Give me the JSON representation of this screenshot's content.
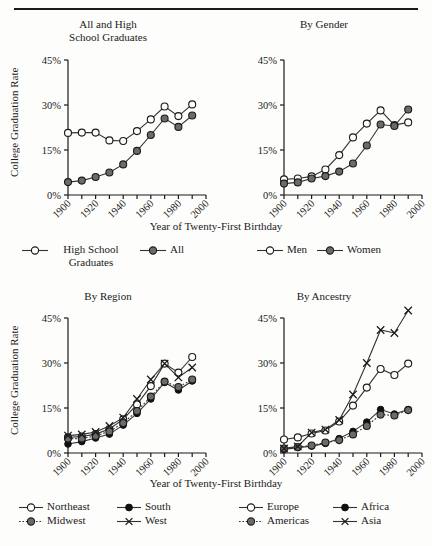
{
  "figure": {
    "has_top_rule": true,
    "y_axis_label": "College Graduation Rate",
    "x_axis_title": "Year of Twenty-First Birthday",
    "y_ticks": [
      "0%",
      "15%",
      "30%",
      "45%"
    ],
    "x_ticks": [
      "1900",
      "1920",
      "1940",
      "1960",
      "1980",
      "2000"
    ]
  },
  "chart_data": [
    {
      "type": "line",
      "title": "All and High School Graduates",
      "xlabel": "Year of Twenty-First Birthday",
      "ylabel": "College Graduation Rate",
      "xlim": [
        1900,
        2000
      ],
      "ylim": [
        0,
        45
      ],
      "yticks": [
        0,
        15,
        30,
        45
      ],
      "xticks": [
        1900,
        1910,
        1920,
        1930,
        1940,
        1950,
        1960,
        1970,
        1980,
        1990,
        2000
      ],
      "xticklabels": [
        "1900",
        "1920",
        "1940",
        "1960",
        "1980",
        "2000"
      ],
      "grid": false,
      "legend_position": "below",
      "x": [
        1900,
        1910,
        1920,
        1930,
        1940,
        1950,
        1960,
        1970,
        1980,
        1990
      ],
      "series": [
        {
          "name": "High School Graduates",
          "marker": "open-circle",
          "linestyle": "solid",
          "values": [
            20.7,
            20.8,
            20.8,
            18.2,
            18.0,
            21.3,
            25.2,
            29.5,
            26.3,
            30.2
          ]
        },
        {
          "name": "All",
          "marker": "filled-gray-circle",
          "linestyle": "solid",
          "values": [
            4.3,
            4.8,
            6.0,
            7.5,
            10.2,
            14.7,
            20.0,
            25.5,
            22.7,
            26.5
          ]
        }
      ]
    },
    {
      "type": "line",
      "title": "By Gender",
      "xlabel": "Year of Twenty-First Birthday",
      "ylabel": "College Graduation Rate",
      "xlim": [
        1900,
        2000
      ],
      "ylim": [
        0,
        45
      ],
      "yticks": [
        0,
        15,
        30,
        45
      ],
      "xticks": [
        1900,
        1910,
        1920,
        1930,
        1940,
        1950,
        1960,
        1970,
        1980,
        1990,
        2000
      ],
      "xticklabels": [
        "1900",
        "1920",
        "1940",
        "1960",
        "1980",
        "2000"
      ],
      "grid": false,
      "legend_position": "below",
      "x": [
        1900,
        1910,
        1920,
        1930,
        1940,
        1950,
        1960,
        1970,
        1980,
        1990
      ],
      "series": [
        {
          "name": "Men",
          "marker": "open-circle",
          "linestyle": "solid",
          "values": [
            5.2,
            5.5,
            6.2,
            8.5,
            13.3,
            19.2,
            23.8,
            28.2,
            23.3,
            24.2
          ]
        },
        {
          "name": "Women",
          "marker": "filled-gray-circle",
          "linestyle": "solid",
          "values": [
            3.8,
            4.2,
            5.5,
            6.3,
            7.8,
            10.5,
            16.5,
            23.5,
            23.0,
            28.5
          ]
        }
      ]
    },
    {
      "type": "line",
      "title": "By Region",
      "xlabel": "Year of Twenty-First Birthday",
      "ylabel": "College Graduation Rate",
      "xlim": [
        1900,
        2000
      ],
      "ylim": [
        0,
        45
      ],
      "yticks": [
        0,
        15,
        30,
        45
      ],
      "xticks": [
        1900,
        1910,
        1920,
        1930,
        1940,
        1950,
        1960,
        1970,
        1980,
        1990,
        2000
      ],
      "xticklabels": [
        "1900",
        "1920",
        "1940",
        "1960",
        "1980",
        "2000"
      ],
      "grid": false,
      "legend_position": "below",
      "x": [
        1900,
        1910,
        1920,
        1930,
        1940,
        1950,
        1960,
        1970,
        1980,
        1990
      ],
      "series": [
        {
          "name": "Northeast",
          "marker": "open-circle",
          "linestyle": "solid",
          "values": [
            5.2,
            5.5,
            6.3,
            8.0,
            11.2,
            16.2,
            22.3,
            29.8,
            26.8,
            32.0
          ]
        },
        {
          "name": "South",
          "marker": "filled-black-circle",
          "linestyle": "solid",
          "values": [
            3.0,
            3.8,
            5.0,
            6.3,
            9.3,
            13.2,
            18.0,
            23.5,
            21.0,
            24.0
          ]
        },
        {
          "name": "Midwest",
          "marker": "filled-gray-circle",
          "linestyle": "dotted",
          "values": [
            4.8,
            4.8,
            5.7,
            7.2,
            10.0,
            14.0,
            18.8,
            23.8,
            22.0,
            24.5
          ]
        },
        {
          "name": "West",
          "marker": "cross",
          "linestyle": "solid",
          "values": [
            5.8,
            6.2,
            7.0,
            9.0,
            11.8,
            18.0,
            24.5,
            29.8,
            25.2,
            28.5
          ]
        }
      ]
    },
    {
      "type": "line",
      "title": "By Ancestry",
      "xlabel": "Year of Twenty-First Birthday",
      "ylabel": "College Graduation Rate",
      "xlim": [
        1900,
        2000
      ],
      "ylim": [
        0,
        45
      ],
      "yticks": [
        0,
        15,
        30,
        45
      ],
      "xticks": [
        1900,
        1910,
        1920,
        1930,
        1940,
        1950,
        1960,
        1970,
        1980,
        1990,
        2000
      ],
      "xticklabels": [
        "1900",
        "1920",
        "1940",
        "1960",
        "1980",
        "2000"
      ],
      "grid": false,
      "legend_position": "below",
      "x": [
        1900,
        1910,
        1920,
        1930,
        1940,
        1950,
        1960,
        1970,
        1980,
        1990
      ],
      "series": [
        {
          "name": "Europe",
          "marker": "open-circle",
          "linestyle": "solid",
          "values": [
            4.5,
            5.2,
            6.5,
            7.5,
            10.5,
            15.8,
            21.8,
            28.0,
            26.0,
            29.8
          ]
        },
        {
          "name": "Africa",
          "marker": "filled-black-circle",
          "linestyle": "solid",
          "values": [
            1.2,
            1.8,
            2.3,
            3.2,
            4.8,
            7.2,
            10.3,
            14.5,
            13.0,
            14.5
          ]
        },
        {
          "name": "Americas",
          "marker": "filled-gray-circle",
          "linestyle": "dotted",
          "values": [
            1.5,
            2.0,
            2.5,
            3.5,
            4.3,
            6.2,
            9.0,
            12.8,
            12.5,
            14.3
          ]
        },
        {
          "name": "Asia",
          "marker": "cross",
          "linestyle": "solid",
          "values": [
            1.5,
            2.2,
            6.8,
            7.8,
            11.0,
            19.5,
            30.0,
            41.0,
            40.0,
            47.5
          ]
        }
      ]
    }
  ],
  "panels": {
    "top_left": {
      "title_line1": "All and High",
      "title_line2": "School Graduates",
      "legend": [
        {
          "label": "High School Graduates",
          "key": "open-circle-line"
        },
        {
          "label": "All",
          "key": "gray-circle-line"
        }
      ]
    },
    "top_right": {
      "title_line1": "By Gender",
      "title_line2": "",
      "legend": [
        {
          "label": "Men",
          "key": "open-circle-line"
        },
        {
          "label": "Women",
          "key": "gray-circle-line"
        }
      ]
    },
    "bottom_left": {
      "title_line1": "By Region",
      "title_line2": "",
      "legend": [
        {
          "label": "Northeast",
          "key": "open-circle-line"
        },
        {
          "label": "South",
          "key": "black-circle-line"
        },
        {
          "label": "Midwest",
          "key": "gray-circle-dotted"
        },
        {
          "label": "West",
          "key": "cross-line"
        }
      ]
    },
    "bottom_right": {
      "title_line1": "By Ancestry",
      "title_line2": "",
      "legend": [
        {
          "label": "Europe",
          "key": "open-circle-line"
        },
        {
          "label": "Africa",
          "key": "black-circle-line"
        },
        {
          "label": "Americas",
          "key": "gray-circle-dotted"
        },
        {
          "label": "Asia",
          "key": "cross-line"
        }
      ]
    }
  },
  "colors": {
    "ink": "#1a1a1a",
    "gray_marker": "#6b6b6b",
    "line": "#333333",
    "background": "#fdfdfb"
  }
}
